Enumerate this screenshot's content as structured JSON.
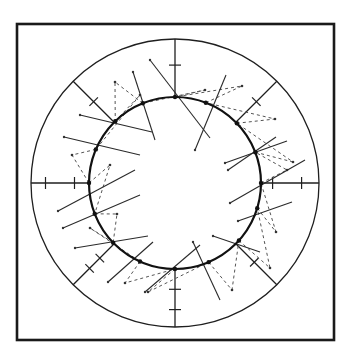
{
  "figure": {
    "type": "concentric-ring-diagram",
    "frame": {
      "x": 17,
      "y": 24,
      "width": 317,
      "height": 316
    },
    "center": {
      "x": 175,
      "y": 183
    },
    "outer_circle_radius": 144,
    "inner_circle_radius": 86,
    "colors": {
      "line": "#1a1a1a",
      "dashed": "#555555",
      "background": "#ffffff"
    },
    "radial_lines": [
      {
        "angle_deg": 90,
        "ticks_at": [
          0.55
        ]
      },
      {
        "angle_deg": 135,
        "ticks_at": [
          0.5
        ]
      },
      {
        "angle_deg": 180,
        "ticks_at": [
          0.25,
          0.75
        ]
      },
      {
        "angle_deg": 225,
        "ticks_at": [
          0.35,
          0.6
        ]
      },
      {
        "angle_deg": 270,
        "ticks_at": [
          0.35,
          0.7
        ]
      },
      {
        "angle_deg": 315,
        "ticks_at": [
          0.45
        ]
      },
      {
        "angle_deg": 0,
        "ticks_at": [
          0.2,
          0.7
        ]
      },
      {
        "angle_deg": 45,
        "ticks_at": [
          0.5
        ]
      }
    ],
    "nodes": [
      {
        "angle_deg": 90,
        "solid": [
          [
            150,
            60
          ],
          [
            210,
            138
          ]
        ],
        "dashed_to": [
          205,
          90
        ]
      },
      {
        "angle_deg": 112,
        "solid": [
          [
            133,
            72
          ],
          [
            155,
            140
          ]
        ],
        "dashed_to": [
          115,
          82
        ]
      },
      {
        "angle_deg": 134,
        "solid": [
          [
            80,
            115
          ],
          [
            152,
            132
          ]
        ],
        "dashed_to": [
          140,
          95
        ]
      },
      {
        "angle_deg": 157,
        "solid": [
          [
            64,
            137
          ],
          [
            140,
            155
          ]
        ],
        "dashed_to": [
          72,
          155
        ]
      },
      {
        "angle_deg": 180,
        "solid": [
          [
            58,
            211
          ],
          [
            135,
            170
          ]
        ],
        "dashed_to": [
          110,
          165
        ]
      },
      {
        "angle_deg": 201,
        "solid": [
          [
            63,
            228
          ],
          [
            140,
            195
          ]
        ],
        "dashed_to": [
          117,
          214
        ]
      },
      {
        "angle_deg": 224,
        "solid": [
          [
            75,
            248
          ],
          [
            148,
            236
          ]
        ],
        "dashed_to": [
          90,
          228
        ]
      },
      {
        "angle_deg": 246,
        "solid": [
          [
            108,
            282
          ],
          [
            153,
            242
          ]
        ],
        "dashed_to": [
          125,
          283
        ]
      },
      {
        "angle_deg": 270,
        "solid": [
          [
            145,
            292
          ],
          [
            200,
            245
          ]
        ],
        "dashed_to": [
          148,
          292
        ]
      },
      {
        "angle_deg": 293,
        "solid": [
          [
            193,
            242
          ],
          [
            220,
            300
          ]
        ],
        "dashed_to": [
          232,
          290
        ]
      },
      {
        "angle_deg": 318,
        "solid": [
          [
            213,
            236
          ],
          [
            260,
            252
          ]
        ],
        "dashed_to": [
          270,
          268
        ]
      },
      {
        "angle_deg": 343,
        "solid": [
          [
            238,
            221
          ],
          [
            292,
            202
          ]
        ],
        "dashed_to": [
          276,
          232
        ]
      },
      {
        "angle_deg": 0,
        "solid": [
          [
            230,
            203
          ],
          [
            305,
            160
          ]
        ],
        "dashed_to": [
          287,
          170
        ]
      },
      {
        "angle_deg": 21,
        "solid": [
          [
            225,
            163
          ],
          [
            287,
            141
          ]
        ],
        "dashed_to": [
          293,
          162
        ]
      },
      {
        "angle_deg": 44,
        "solid": [
          [
            228,
            170
          ],
          [
            276,
            137
          ]
        ],
        "dashed_to": [
          275,
          119
        ]
      },
      {
        "angle_deg": 69,
        "solid": [
          [
            195,
            150
          ],
          [
            226,
            75
          ]
        ],
        "dashed_to": [
          242,
          86
        ]
      }
    ]
  }
}
